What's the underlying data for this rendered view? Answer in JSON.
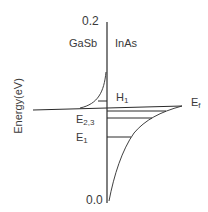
{
  "diagram": {
    "y_axis": {
      "label": "Energy(eV)",
      "top_tick": "0.2",
      "bottom_tick": "0.0"
    },
    "regions": {
      "left": "GaSb",
      "right": "InAs"
    },
    "levels": {
      "hole": {
        "main": "H",
        "sub": "1"
      },
      "electron_23": {
        "main": "E",
        "sub": "2,3"
      },
      "electron_1": {
        "main": "E",
        "sub": "1"
      },
      "fermi": {
        "main": "E",
        "sub": "f"
      }
    },
    "colors": {
      "line": "#2a2a2a",
      "text": "#3a3a3a",
      "background": "#ffffff"
    }
  }
}
